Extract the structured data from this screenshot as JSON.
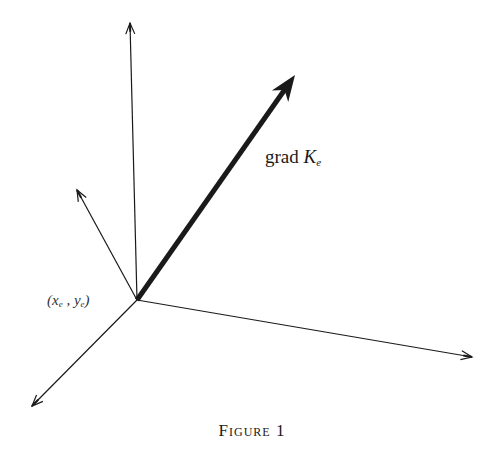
{
  "figure": {
    "caption": "Figure 1",
    "stroke_color": "#1a1a1a",
    "background": "#ffffff",
    "origin": {
      "x": 137,
      "y": 300,
      "label_open": "(",
      "label_x": "x",
      "label_x_sub": "e",
      "label_sep": " , ",
      "label_y": "y",
      "label_y_sub": "e",
      "label_close": ")"
    },
    "gradient_vector": {
      "label_prefix": "grad ",
      "label_symbol": "K",
      "label_sub": "e"
    },
    "vectors": [
      {
        "name": "vertical-axis",
        "x1": 137,
        "y1": 300,
        "x2": 130,
        "y2": 23,
        "width": 1.2,
        "style": "open-arrow"
      },
      {
        "name": "upper-left-vector",
        "x1": 137,
        "y1": 300,
        "x2": 77,
        "y2": 190,
        "width": 1.2,
        "style": "open-arrow"
      },
      {
        "name": "grad-vector",
        "x1": 137,
        "y1": 300,
        "x2": 295,
        "y2": 75,
        "width": 5,
        "style": "bold-arrow"
      },
      {
        "name": "right-axis",
        "x1": 137,
        "y1": 300,
        "x2": 472,
        "y2": 357,
        "width": 1.2,
        "style": "open-arrow"
      },
      {
        "name": "lower-left-axis",
        "x1": 137,
        "y1": 300,
        "x2": 32,
        "y2": 406,
        "width": 1.2,
        "style": "open-arrow"
      }
    ]
  }
}
